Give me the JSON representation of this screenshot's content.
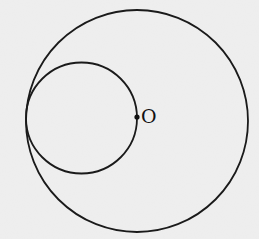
{
  "diagram": {
    "background": "#ededed",
    "stroke_color": "#1a1a1a",
    "large_circle": {
      "cx": 137,
      "cy": 121,
      "r": 111
    },
    "small_circle": {
      "cx": 81.5,
      "cy": 118,
      "r": 55.5
    },
    "center_point": {
      "cx": 137,
      "cy": 117,
      "r": 2.6,
      "label": "O"
    }
  }
}
